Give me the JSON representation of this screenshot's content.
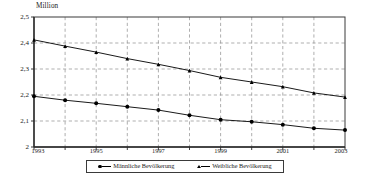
{
  "chart_data": {
    "type": "line",
    "title": "",
    "subtitle": "",
    "unit_label": "Million",
    "xlabel": "",
    "ylabel": "",
    "x": [
      1993,
      1994,
      1995,
      1996,
      1997,
      1998,
      1999,
      2000,
      2001,
      2002,
      2003
    ],
    "xtick_labels": [
      "1993",
      "1995",
      "1997",
      "1999",
      "2001",
      "2003"
    ],
    "xtick_values": [
      1993,
      1995,
      1997,
      1999,
      2001,
      2003
    ],
    "ytick_labels": [
      "2",
      "2,1",
      "2,2",
      "2,3",
      "2,4",
      "2,5"
    ],
    "ytick_values": [
      2.0,
      2.1,
      2.2,
      2.3,
      2.4,
      2.5
    ],
    "xlim": [
      1993,
      2003
    ],
    "ylim": [
      2.0,
      2.5
    ],
    "grid": true,
    "legend_position": "bottom",
    "series": [
      {
        "name": "Männliche Bevölkerung",
        "marker": "circle",
        "color": "#000000",
        "values": [
          2.195,
          2.18,
          2.168,
          2.155,
          2.142,
          2.122,
          2.105,
          2.097,
          2.086,
          2.072,
          2.065
        ]
      },
      {
        "name": "Weibliche Bevölkerung",
        "marker": "triangle",
        "color": "#000000",
        "values": [
          2.412,
          2.388,
          2.365,
          2.34,
          2.318,
          2.294,
          2.268,
          2.25,
          2.232,
          2.208,
          2.192
        ]
      }
    ]
  },
  "legend": {
    "items": [
      {
        "label": "Männliche Bevölkerung",
        "marker": "circle-marker"
      },
      {
        "label": "Weibliche Bevölkerung",
        "marker": "triangle-marker"
      }
    ]
  }
}
